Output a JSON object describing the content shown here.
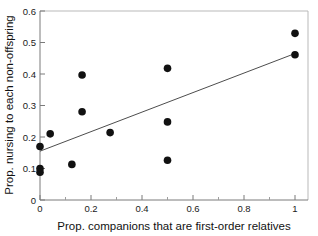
{
  "chart_data": {
    "type": "scatter",
    "title": "",
    "xlabel": "Prop. companions that are first-order relatives",
    "ylabel": "Prop. nursing to each non-offspring",
    "xlim": [
      0,
      1.05
    ],
    "ylim": [
      0,
      0.6
    ],
    "xticks": [
      0,
      0.2,
      0.4,
      0.6,
      0.8,
      1
    ],
    "xticklabels": [
      "0",
      "0.2",
      "0.4",
      "0.6",
      "0.8",
      "1"
    ],
    "yticks": [
      0,
      0.1,
      0.2,
      0.3,
      0.4,
      0.5,
      0.6
    ],
    "yticklabels": [
      "0",
      "0.1",
      "0.2",
      "0.3",
      "0.4",
      "0.5",
      "0.6"
    ],
    "grid": false,
    "legend": null,
    "points": [
      {
        "x": 0.0,
        "y": 0.17
      },
      {
        "x": 0.0,
        "y": 0.1
      },
      {
        "x": 0.0,
        "y": 0.088
      },
      {
        "x": 0.04,
        "y": 0.21
      },
      {
        "x": 0.125,
        "y": 0.113
      },
      {
        "x": 0.165,
        "y": 0.397
      },
      {
        "x": 0.165,
        "y": 0.28
      },
      {
        "x": 0.275,
        "y": 0.214
      },
      {
        "x": 0.5,
        "y": 0.418
      },
      {
        "x": 0.5,
        "y": 0.248
      },
      {
        "x": 0.5,
        "y": 0.126
      },
      {
        "x": 1.0,
        "y": 0.529
      },
      {
        "x": 1.0,
        "y": 0.461
      }
    ],
    "fit_line": {
      "x_start": 0.0,
      "y_start": 0.155,
      "x_end": 1.0,
      "y_end": 0.465
    },
    "marker": {
      "shape": "filled-circle",
      "color": "#111111",
      "size_px": 5
    },
    "line_color": "#4d4d4d"
  }
}
